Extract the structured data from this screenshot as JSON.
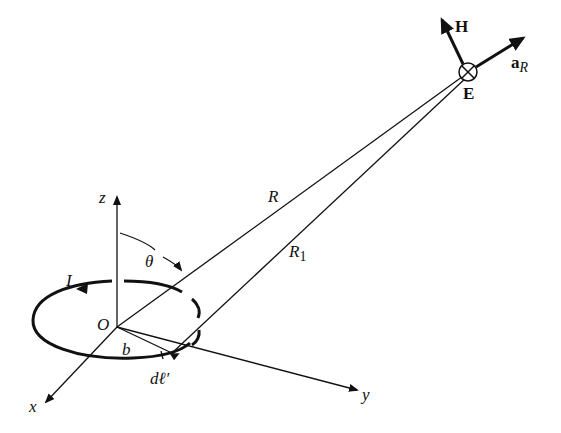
{
  "figure": {
    "type": "diagram",
    "labels": {
      "z_axis": "z",
      "x_axis": "x",
      "y_axis": "y",
      "origin": "O",
      "angle": "θ",
      "current": "I",
      "radius": "b",
      "element": "dℓ′",
      "distance_R": "R",
      "distance_R1": "R",
      "distance_R1_sub": "1",
      "H_field": "H",
      "E_field": "E",
      "unit_vector": "a",
      "unit_vector_sub": "R"
    },
    "colors": {
      "ink": "#111111",
      "background": "#ffffff"
    }
  }
}
